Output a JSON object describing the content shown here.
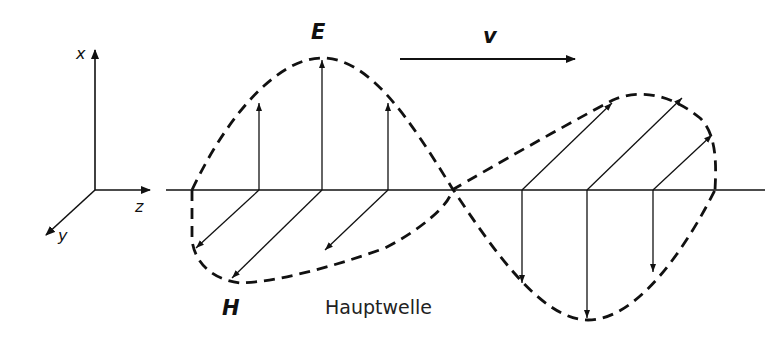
{
  "diagram": {
    "caption": "Hauptwelle",
    "field_labels": {
      "electric": "E",
      "magnetic": "H",
      "velocity": "v"
    },
    "axes": {
      "x": "x",
      "y": "y",
      "z": "z"
    },
    "colors": {
      "ink": "#111111",
      "background": "#ffffff"
    }
  }
}
